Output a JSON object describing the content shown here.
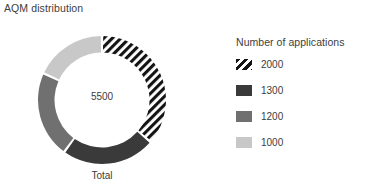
{
  "chart_data": {
    "type": "pie",
    "title": "AQM distribution",
    "subtitle": "",
    "xlabel": "Total",
    "ylabel": "",
    "categories": [
      "2000",
      "1300",
      "1200",
      "1000"
    ],
    "values": [
      2000,
      1300,
      1200,
      1000
    ],
    "total": 5500,
    "center_label": "5500",
    "legend_title": "Number of applications",
    "legend_position": "right",
    "grid": false,
    "donut": true,
    "slices": [
      {
        "label": "2000",
        "value": 2000,
        "color": "#1a1a1a",
        "pattern": "diagonal-hatch",
        "start_angle": 0,
        "sweep_angle": 130.9
      },
      {
        "label": "1300",
        "value": 1300,
        "color": "#3a3a3a",
        "pattern": "solid",
        "start_angle": 130.9,
        "sweep_angle": 85.1
      },
      {
        "label": "1200",
        "value": 1200,
        "color": "#707070",
        "pattern": "solid",
        "start_angle": 216.0,
        "sweep_angle": 78.5
      },
      {
        "label": "1000",
        "value": 1000,
        "color": "#c8c8c8",
        "pattern": "solid",
        "start_angle": 294.5,
        "sweep_angle": 65.5
      }
    ]
  },
  "chart": {
    "title": "AQM distribution",
    "center_value": "5500",
    "axis_label": "Total"
  },
  "legend": {
    "title": "Number of applications",
    "items": [
      {
        "label": "2000",
        "color": "#1a1a1a"
      },
      {
        "label": "1300",
        "color": "#3a3a3a"
      },
      {
        "label": "1200",
        "color": "#707070"
      },
      {
        "label": "1000",
        "color": "#c8c8c8"
      }
    ]
  }
}
